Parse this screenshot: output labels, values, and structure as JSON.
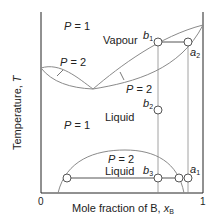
{
  "diagram": {
    "type": "temperature-composition phase diagram",
    "x_axis": {
      "label_prefix": "Mole fraction of B, ",
      "label_var": "x",
      "label_sub": "B",
      "tick_min": "0",
      "tick_max": "1"
    },
    "y_axis": {
      "label_prefix": "Temperature, ",
      "label_var": "T"
    },
    "regions": {
      "vapour_label": "Vapour",
      "liquid_upper_label": "Liquid",
      "liquid_lower_label": "Liquid",
      "p1_top": {
        "var": "P",
        "text": " = 1"
      },
      "p1_mid": {
        "var": "P",
        "text": " = 1"
      },
      "p2_left": {
        "var": "P",
        "text": " = 2"
      },
      "p2_right": {
        "var": "P",
        "text": " = 2"
      },
      "p2_dome": {
        "var": "P",
        "text": " = 2"
      }
    },
    "points": {
      "b1": {
        "var": "b",
        "sub": "1"
      },
      "a2": {
        "var": "a",
        "sub": "2"
      },
      "b2": {
        "var": "b",
        "sub": "2"
      },
      "b3": {
        "var": "b",
        "sub": "3"
      },
      "a1": {
        "var": "a",
        "sub": "1"
      }
    },
    "colors": {
      "axis": "#222222",
      "curve": "#8a8a8a",
      "tie_line": "#555555",
      "marker_fill": "#ffffff"
    }
  }
}
